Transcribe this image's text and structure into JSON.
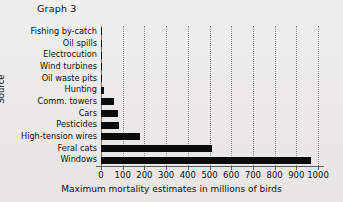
{
  "title": "Graph 3",
  "chart_data": {
    "type": "bar",
    "orientation": "horizontal",
    "title": "Graph 3",
    "xlabel": "Maximum mortality estimates in millions of birds",
    "ylabel": "Source",
    "xlim": [
      0,
      1000
    ],
    "xticks": [
      "0",
      "100",
      "200",
      "300",
      "400",
      "500",
      "600",
      "700",
      "800",
      "900",
      "1000"
    ],
    "grid": "vertical-dotted",
    "legend": "none",
    "bar_color": "#0b0b0b",
    "categories": [
      "Fishing by-catch",
      "Oil spills",
      "Electrocution",
      "Wind turbines",
      "Oil waste pits",
      "Hunting",
      "Comm. towers",
      "Cars",
      "Pesticides",
      "High-tension wires",
      "Feral cats",
      "Windows"
    ],
    "values": [
      3,
      3,
      4,
      5,
      6,
      16,
      60,
      80,
      85,
      180,
      510,
      970
    ]
  }
}
